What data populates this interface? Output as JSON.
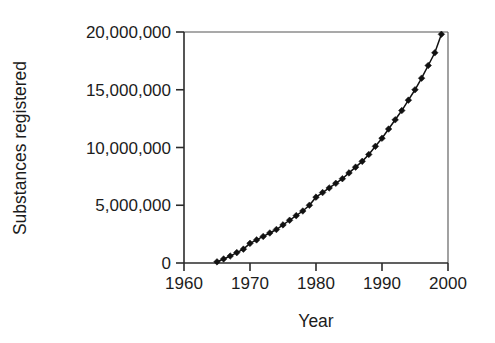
{
  "chart_data": {
    "type": "line",
    "title": "",
    "subtitle": "",
    "xlabel": "Year",
    "ylabel": "Substances registered",
    "xlim": [
      1960,
      2000
    ],
    "ylim": [
      0,
      20000000
    ],
    "xticks": [
      1960,
      1970,
      1980,
      1990,
      2000
    ],
    "xtick_labels": [
      "1960",
      "1970",
      "1980",
      "1990",
      "2000"
    ],
    "yticks": [
      0,
      5000000,
      10000000,
      15000000,
      20000000
    ],
    "ytick_labels": [
      "0",
      "5,000,000",
      "10,000,000",
      "15,000,000",
      "20,000,000"
    ],
    "grid": false,
    "legend": false,
    "legend_position": "none",
    "marker": "diamond",
    "marker_color": "#111111",
    "line_color": "#111111",
    "background_color": "#ffffff",
    "axis_color": "#2b2b2b",
    "annotations": [],
    "series": [
      {
        "name": "Substances registered",
        "x": [
          1965,
          1966,
          1967,
          1968,
          1969,
          1970,
          1971,
          1972,
          1973,
          1974,
          1975,
          1976,
          1977,
          1978,
          1979,
          1980,
          1981,
          1982,
          1983,
          1984,
          1985,
          1986,
          1987,
          1988,
          1989,
          1990,
          1991,
          1992,
          1993,
          1994,
          1995,
          1996,
          1997,
          1998,
          1999
        ],
        "values": [
          100000,
          350000,
          600000,
          900000,
          1200000,
          1700000,
          2000000,
          2300000,
          2600000,
          2900000,
          3300000,
          3700000,
          4100000,
          4500000,
          5000000,
          5700000,
          6100000,
          6500000,
          6900000,
          7300000,
          7800000,
          8300000,
          8800000,
          9400000,
          10100000,
          10800000,
          11600000,
          12400000,
          13200000,
          14100000,
          15000000,
          16000000,
          17100000,
          18200000,
          19800000
        ]
      }
    ]
  }
}
